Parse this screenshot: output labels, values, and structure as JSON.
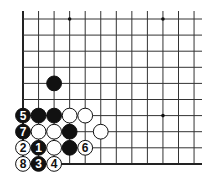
{
  "diagram": {
    "type": "go-board-corner",
    "grid": {
      "columns": 12,
      "rows": 10,
      "origin_x": 23,
      "origin_y": 19,
      "spacing_x": 15.55,
      "spacing_y": 16.1,
      "line_top": 11,
      "line_right": 202,
      "edges": [
        "left",
        "bottom"
      ],
      "line_color": "#333333",
      "edge_color": "#222222"
    },
    "star_points": [
      {
        "col": 4,
        "row": 1
      },
      {
        "col": 10,
        "row": 1
      },
      {
        "col": 10,
        "row": 7
      }
    ],
    "stones": [
      {
        "col": 3,
        "row": 5,
        "color": "black",
        "label": ""
      },
      {
        "col": 1,
        "row": 7,
        "color": "black",
        "label": "5"
      },
      {
        "col": 2,
        "row": 7,
        "color": "black",
        "label": ""
      },
      {
        "col": 3,
        "row": 7,
        "color": "black",
        "label": ""
      },
      {
        "col": 4,
        "row": 7,
        "color": "white",
        "label": ""
      },
      {
        "col": 5,
        "row": 7,
        "color": "white",
        "label": ""
      },
      {
        "col": 1,
        "row": 8,
        "color": "black",
        "label": "7"
      },
      {
        "col": 2,
        "row": 8,
        "color": "white",
        "label": ""
      },
      {
        "col": 3,
        "row": 8,
        "color": "white",
        "label": ""
      },
      {
        "col": 4,
        "row": 8,
        "color": "black",
        "label": ""
      },
      {
        "col": 6,
        "row": 8,
        "color": "white",
        "label": ""
      },
      {
        "col": 1,
        "row": 9,
        "color": "white",
        "label": "2"
      },
      {
        "col": 2,
        "row": 9,
        "color": "black",
        "label": "1"
      },
      {
        "col": 3,
        "row": 9,
        "color": "white",
        "label": ""
      },
      {
        "col": 4,
        "row": 9,
        "color": "black",
        "label": ""
      },
      {
        "col": 5,
        "row": 9,
        "color": "white",
        "label": "6"
      },
      {
        "col": 1,
        "row": 10,
        "color": "white",
        "label": "8"
      },
      {
        "col": 2,
        "row": 10,
        "color": "black",
        "label": "3"
      },
      {
        "col": 3,
        "row": 10,
        "color": "white",
        "label": "4"
      }
    ]
  }
}
